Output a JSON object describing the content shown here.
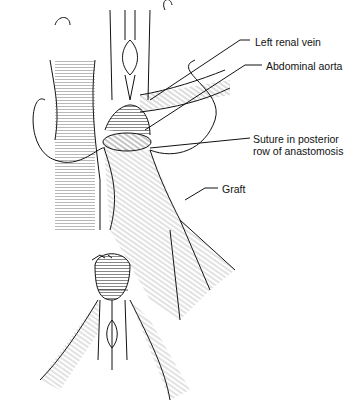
{
  "figure": {
    "type": "surgical illustration",
    "labels": [
      {
        "id": "left-renal-vein",
        "text": "Left renal vein"
      },
      {
        "id": "abdominal-aorta",
        "text": "Abdominal aorta"
      },
      {
        "id": "suture",
        "line1": "Suture in posterior",
        "line2": "row of anastomosis"
      },
      {
        "id": "graft",
        "text": "Graft"
      }
    ],
    "colors": {
      "line": "#111111",
      "background": "#ffffff"
    }
  }
}
